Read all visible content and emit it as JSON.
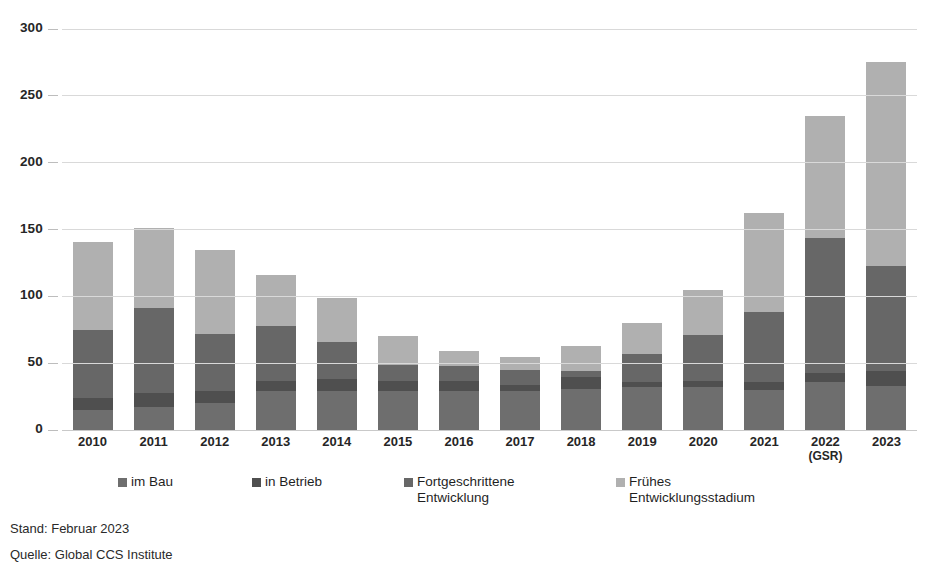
{
  "chart_data": {
    "type": "bar",
    "subtype": "stacked-bar",
    "title": "",
    "xlabel": "",
    "ylabel": "",
    "ylim": [
      0,
      300
    ],
    "yticks": [
      0,
      50,
      100,
      150,
      200,
      250,
      300
    ],
    "grid": true,
    "legend_position": "bottom",
    "categories": [
      "2010",
      "2011",
      "2012",
      "2013",
      "2014",
      "2015",
      "2016",
      "2017",
      "2018",
      "2019",
      "2020",
      "2021",
      "2022",
      "2023"
    ],
    "category_sublabels": [
      "",
      "",
      "",
      "",
      "",
      "",
      "",
      "",
      "",
      "",
      "",
      "",
      "(GSR)",
      ""
    ],
    "series": [
      {
        "name": "im Bau",
        "color": "#6e6e6e",
        "values": [
          15,
          17,
          20,
          29,
          29,
          29,
          29,
          29,
          31,
          32,
          32,
          30,
          36,
          33
        ]
      },
      {
        "name": "in Betrieb",
        "color": "#4f4f4f",
        "values": [
          9,
          11,
          9,
          8,
          9,
          8,
          8,
          5,
          9,
          4,
          5,
          6,
          7,
          11
        ]
      },
      {
        "name": "Fortgeschrittene Entwicklung",
        "color": "#676767",
        "values": [
          51,
          63,
          43,
          41,
          28,
          12,
          11,
          11,
          4,
          21,
          34,
          52,
          101,
          79
        ]
      },
      {
        "name": "Frühes Entwicklungsstadium",
        "color": "#b0b0b0",
        "values": [
          66,
          60,
          63,
          38,
          33,
          21,
          11,
          10,
          19,
          23,
          34,
          74,
          91,
          152
        ]
      }
    ],
    "totals": [
      141,
      151,
      135,
      116,
      99,
      70,
      59,
      55,
      63,
      80,
      105,
      162,
      235,
      275
    ]
  },
  "legend": {
    "items": [
      {
        "label": "im Bau",
        "color": "#6e6e6e"
      },
      {
        "label": "in Betrieb",
        "color": "#4f4f4f"
      },
      {
        "label": "Fortgeschrittene\nEntwicklung",
        "color": "#676767"
      },
      {
        "label": "Frühes\nEntwicklungsstadium",
        "color": "#b0b0b0"
      }
    ]
  },
  "footer": {
    "line1": "Stand: Februar 2023",
    "line2": "Quelle: Global CCS Institute"
  }
}
